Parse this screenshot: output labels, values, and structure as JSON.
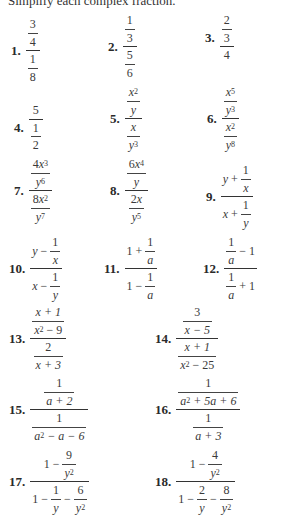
{
  "header": {
    "instruction": "Simplify each complex fraction."
  },
  "problems": [
    {
      "number": "1.",
      "expr": "(3/4)/(1/8)",
      "parts": {
        "a": "3",
        "b": "4",
        "c": "1",
        "d": "8"
      }
    },
    {
      "number": "2.",
      "expr": "(1/3)/(5/6)",
      "parts": {
        "a": "1",
        "b": "3",
        "c": "5",
        "d": "6"
      }
    },
    {
      "number": "3.",
      "expr": "(2/3)/4",
      "parts": {
        "a": "2",
        "b": "3",
        "c": "4"
      }
    },
    {
      "number": "4.",
      "expr": "5/(1/2)",
      "parts": {
        "a": "5",
        "b": "1",
        "c": "2"
      }
    },
    {
      "number": "5.",
      "expr": "(x^2/y)/(x/y^3)",
      "parts": {
        "x": "x",
        "y": "y",
        "e1": "2",
        "e2": "3"
      }
    },
    {
      "number": "6.",
      "expr": "(x^5/y^3)/(x^2/y^8)",
      "parts": {
        "x": "x",
        "y": "y",
        "e1": "5",
        "e2": "3",
        "e3": "2",
        "e4": "8"
      }
    },
    {
      "number": "7.",
      "expr": "(4x^3/y^6)/(8x^2/y^7)",
      "parts": {
        "c1": "4",
        "c2": "8",
        "x": "x",
        "y": "y",
        "e1": "3",
        "e2": "6",
        "e3": "2",
        "e4": "7"
      }
    },
    {
      "number": "8.",
      "expr": "(6x^4/y)/(2x/y^5)",
      "parts": {
        "c1": "6",
        "c2": "2",
        "x": "x",
        "y": "y",
        "e1": "4",
        "e2": "5"
      }
    },
    {
      "number": "9.",
      "expr": "(y + 1/x)/(x + 1/y)",
      "parts": {
        "x": "x",
        "y": "y",
        "one": "1",
        "plus": "+"
      }
    },
    {
      "number": "10.",
      "expr": "(y - 1/x)/(x - 1/y)",
      "parts": {
        "x": "x",
        "y": "y",
        "one": "1",
        "minus": "−"
      }
    },
    {
      "number": "11.",
      "expr": "(1 + 1/a)/(1 - 1/a)",
      "parts": {
        "a": "a",
        "one": "1",
        "plus": "+",
        "minus": "−"
      }
    },
    {
      "number": "12.",
      "expr": "(1/a - 1)/(1/a + 1)",
      "parts": {
        "a": "a",
        "one": "1",
        "plus": "+",
        "minus": "−"
      }
    },
    {
      "number": "13.",
      "expr": "((x+1)/(x^2-9))/(2/(x+3))",
      "parts": {
        "n1": "x + 1",
        "x": "x",
        "e": "2",
        "m9": "− 9",
        "two": "2",
        "d2": "x + 3"
      }
    },
    {
      "number": "14.",
      "expr": "(3/(x-5))/((x+1)/(x^2-25))",
      "parts": {
        "three": "3",
        "d1": "x − 5",
        "n2": "x + 1",
        "x": "x",
        "e": "2",
        "m25": "− 25"
      }
    },
    {
      "number": "15.",
      "expr": "(1/(a+2))/(1/(a^2-a-6))",
      "parts": {
        "one": "1",
        "d1": "a + 2",
        "a": "a",
        "e": "2",
        "rest": "− a − 6"
      }
    },
    {
      "number": "16.",
      "expr": "(1/(a^2+5a+6))/(1/(a+3))",
      "parts": {
        "one": "1",
        "a": "a",
        "e": "2",
        "rest": "+ 5a + 6",
        "d2": "a + 3"
      }
    },
    {
      "number": "17.",
      "expr": "(1 - 9/y^2)/(1 - 1/y - 6/y^2)",
      "parts": {
        "one": "1",
        "nine": "9",
        "six": "6",
        "y": "y",
        "e": "2",
        "minus": "−"
      }
    },
    {
      "number": "18.",
      "expr": "(1 - 4/y^2)/(1 - 2/y - 8/y^2)",
      "parts": {
        "one": "1",
        "four": "4",
        "two": "2",
        "eight": "8",
        "y": "y",
        "e": "2",
        "minus": "−"
      }
    }
  ]
}
